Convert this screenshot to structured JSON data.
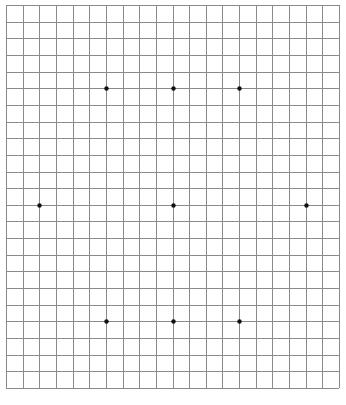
{
  "diagram": {
    "type": "grid-with-dots",
    "grid": {
      "origin_x": 6,
      "origin_y": 5,
      "cell_size": 16.65,
      "columns": 20,
      "rows": 23,
      "line_color": "#8a8a8a",
      "line_width": 1
    },
    "dot_color": "#111111",
    "dot_radius": 2.2,
    "dots": [
      {
        "col": 6,
        "row": 5
      },
      {
        "col": 10,
        "row": 5
      },
      {
        "col": 14,
        "row": 5
      },
      {
        "col": 2,
        "row": 12
      },
      {
        "col": 10,
        "row": 12
      },
      {
        "col": 18,
        "row": 12
      },
      {
        "col": 6,
        "row": 19
      },
      {
        "col": 10,
        "row": 19
      },
      {
        "col": 14,
        "row": 19
      }
    ]
  }
}
